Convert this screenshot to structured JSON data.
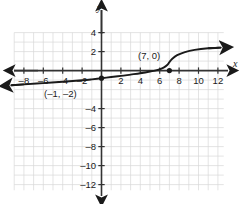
{
  "chart_data": {
    "type": "line",
    "title": "",
    "xlabel": "x",
    "ylabel": "y",
    "grid": true,
    "legend": null,
    "xlim": [
      -9,
      13
    ],
    "ylim": [
      -13,
      5
    ],
    "x_ticks": [
      -8,
      -6,
      -4,
      -2,
      2,
      4,
      6,
      8,
      10,
      12
    ],
    "x_tick_labels": [
      "–8",
      "–6",
      "–4",
      "–2",
      "2",
      "4",
      "6",
      "8",
      "10",
      "12"
    ],
    "y_ticks": [
      4,
      2,
      -4,
      -6,
      -8,
      -10,
      -12
    ],
    "y_tick_labels": [
      "4",
      "2",
      "–4",
      "–6",
      "–8",
      "–10",
      "–12"
    ],
    "grid_x_range": [
      -9,
      12.6
    ],
    "grid_y_range": [
      -12.6,
      4
    ],
    "series": [
      {
        "name": "curve",
        "shape": "cube-root",
        "arrow_start": true,
        "arrow_end": true,
        "description": "Increasing curve, shallow at the ends, steep near x = 7, crossing the x-axis at (7, 0)",
        "points": [
          [
            -9.3,
            -1.55
          ],
          [
            -8.0,
            -1.45
          ],
          [
            -6.0,
            -1.32
          ],
          [
            -4.0,
            -1.18
          ],
          [
            -2.0,
            -1.02
          ],
          [
            -1.0,
            -0.92
          ],
          [
            0.0,
            -0.8
          ],
          [
            1.0,
            -0.68
          ],
          [
            2.0,
            -0.56
          ],
          [
            3.0,
            -0.42
          ],
          [
            4.0,
            -0.28
          ],
          [
            5.0,
            -0.1
          ],
          [
            5.8,
            0.08
          ],
          [
            6.4,
            0.32
          ],
          [
            6.8,
            0.62
          ],
          [
            7.0,
            0.9
          ],
          [
            7.3,
            1.25
          ],
          [
            7.8,
            1.62
          ],
          [
            8.6,
            1.95
          ],
          [
            9.6,
            2.18
          ],
          [
            11.0,
            2.35
          ],
          [
            12.3,
            2.42
          ]
        ]
      }
    ],
    "points_marked": [
      {
        "label": "(7, 0)",
        "x": 7,
        "y": 0,
        "label_x": 5.1,
        "label_y": 1.65,
        "filled": true
      },
      {
        "label": "(–1, –2)",
        "x": 0,
        "y": -0.8,
        "label_x": -4.3,
        "label_y": -2.05,
        "filled": true
      }
    ],
    "annotations": [
      {
        "text": "(7, 0)",
        "x": 5.1,
        "y": 1.65
      },
      {
        "text": "(–1, –2)",
        "x": -4.3,
        "y": -2.05
      }
    ],
    "colors": {
      "grid": "#d8d8d8",
      "axis": "#333333",
      "curve": "#1a1a1a",
      "text": "#1a1a1a",
      "background": "#ffffff"
    }
  },
  "axes": {
    "x_axis_label": "x",
    "y_axis_label": "y"
  },
  "labels": {
    "point_upper": "(7, 0)",
    "point_lower": "(–1, –2)",
    "x_ticks": [
      "–8",
      "–6",
      "–4",
      "–2",
      "2",
      "4",
      "6",
      "8",
      "10",
      "12"
    ],
    "y_ticks": [
      "4",
      "2",
      "–4",
      "–6",
      "–8",
      "–10",
      "–12"
    ]
  }
}
